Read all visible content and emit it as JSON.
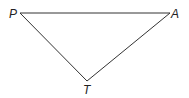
{
  "diagram": {
    "type": "triangle",
    "vertices": [
      {
        "label": "P",
        "x": 20,
        "y": 13
      },
      {
        "label": "A",
        "x": 170,
        "y": 13
      },
      {
        "label": "T",
        "x": 87,
        "y": 81
      }
    ],
    "edges": [
      [
        "P",
        "A"
      ],
      [
        "A",
        "T"
      ],
      [
        "T",
        "P"
      ]
    ],
    "line_color": "#333333"
  }
}
